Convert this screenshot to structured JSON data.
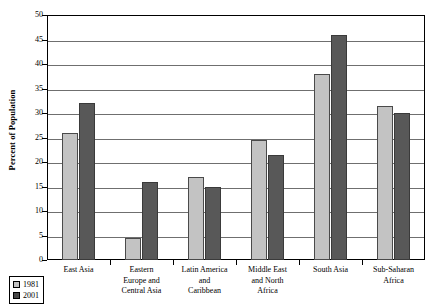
{
  "chart_data": {
    "type": "bar",
    "title": "",
    "xlabel": "",
    "ylabel": "Percent of Population",
    "ylim": [
      0,
      50
    ],
    "ytick_step": 5,
    "yticks": [
      "50",
      "45",
      "40",
      "35",
      "30",
      "25",
      "20",
      "15",
      "10",
      "5",
      "0"
    ],
    "grid": true,
    "legend_position": "bottom-left",
    "categories": [
      "East Asia",
      "Eastern\nEurope and\nCentral Asia",
      "Latin America\nand\nCaribbean",
      "Middle East\nand North\nAfrica",
      "South Asia",
      "Sub-Saharan\nAfrica"
    ],
    "series": [
      {
        "name": "1981",
        "color": "#c3c3c3",
        "values": [
          26,
          4.5,
          17,
          24.5,
          38,
          31.5
        ]
      },
      {
        "name": "2001",
        "color": "#585858",
        "values": [
          32,
          16,
          15,
          21.5,
          46,
          30
        ]
      }
    ]
  },
  "legend": {
    "items": [
      {
        "label": "1981"
      },
      {
        "label": "2001"
      }
    ]
  }
}
